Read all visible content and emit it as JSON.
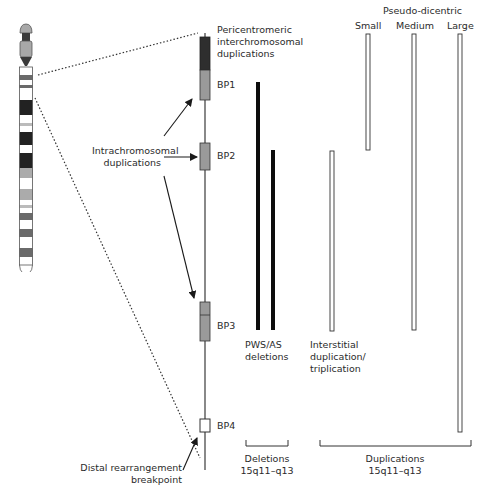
{
  "diagram": {
    "type": "chromosome-15q11-q13-rearrangement-map",
    "chromosome_ideogram": {
      "bands": [
        {
          "y": 67,
          "h": 8,
          "shade": "#ffffff"
        },
        {
          "y": 75,
          "h": 5,
          "shade": "#6a6a6a"
        },
        {
          "y": 80,
          "h": 5,
          "shade": "#ffffff"
        },
        {
          "y": 85,
          "h": 3,
          "shade": "#6a6a6a"
        },
        {
          "y": 88,
          "h": 12,
          "shade": "#ffffff"
        },
        {
          "y": 100,
          "h": 15,
          "shade": "#222222"
        },
        {
          "y": 115,
          "h": 8,
          "shade": "#ffffff"
        },
        {
          "y": 123,
          "h": 3,
          "shade": "#bbbbbb"
        },
        {
          "y": 126,
          "h": 6,
          "shade": "#ffffff"
        },
        {
          "y": 132,
          "h": 13,
          "shade": "#222222"
        },
        {
          "y": 145,
          "h": 8,
          "shade": "#ffffff"
        },
        {
          "y": 153,
          "h": 15,
          "shade": "#222222"
        },
        {
          "y": 168,
          "h": 10,
          "shade": "#ababab"
        },
        {
          "y": 178,
          "h": 11,
          "shade": "#ffffff"
        },
        {
          "y": 189,
          "h": 11,
          "shade": "#ababab"
        },
        {
          "y": 200,
          "h": 5,
          "shade": "#ffffff"
        },
        {
          "y": 205,
          "h": 3,
          "shade": "#bbbbbb"
        },
        {
          "y": 208,
          "h": 5,
          "shade": "#ffffff"
        },
        {
          "y": 213,
          "h": 7,
          "shade": "#6a6a6a"
        },
        {
          "y": 220,
          "h": 9,
          "shade": "#ffffff"
        },
        {
          "y": 229,
          "h": 8,
          "shade": "#6a6a6a"
        },
        {
          "y": 237,
          "h": 11,
          "shade": "#ffffff"
        },
        {
          "y": 248,
          "h": 9,
          "shade": "#6a6a6a"
        },
        {
          "y": 257,
          "h": 8,
          "shade": "#ffffff"
        }
      ]
    },
    "labels": {
      "pericentromeric": [
        "Pericentromeric",
        "interchromosomal",
        "duplications"
      ],
      "bp1": "BP1",
      "bp2": "BP2",
      "bp3": "BP3",
      "bp4": "BP4",
      "intrachromosomal": [
        "Intrachromosomal",
        "duplications"
      ],
      "distal": [
        "Distal rearrangement",
        "breakpoint"
      ],
      "pseudo_dicentric": "Pseudo-dicentric",
      "small": "Small",
      "medium": "Medium",
      "large": "Large",
      "pws_as": [
        "PWS/AS",
        "deletions"
      ],
      "interstitial": [
        "Interstitial",
        "duplication/",
        "triplication"
      ],
      "deletions_group": [
        "Deletions",
        "15q11–q13"
      ],
      "duplications_group": [
        "Duplications",
        "15q11–q13"
      ]
    },
    "breakpoints": [
      {
        "name": "BP1",
        "y_top": 37,
        "y_bottom": 100,
        "style": "dark-over-grey"
      },
      {
        "name": "BP2",
        "y_top": 143,
        "y_bottom": 170,
        "style": "grey"
      },
      {
        "name": "BP3",
        "y_top": 302,
        "y_bottom": 341,
        "style": "grey-split"
      },
      {
        "name": "BP4",
        "y_top": 420,
        "y_bottom": 432,
        "style": "white"
      }
    ],
    "rearrangements": [
      {
        "group": "Deletions",
        "name": "PWS/AS deletion (BP1–BP3)",
        "from": "BP1",
        "to": "BP3",
        "fill": "solid"
      },
      {
        "group": "Deletions",
        "name": "PWS/AS deletion (BP2–BP3)",
        "from": "BP2",
        "to": "BP3",
        "fill": "solid"
      },
      {
        "group": "Duplications",
        "name": "Interstitial duplication/triplication",
        "from": "BP2",
        "to": "BP3",
        "fill": "hollow"
      },
      {
        "group": "Duplications",
        "name": "Pseudo-dicentric Small",
        "from": "cen",
        "to": "BP2",
        "fill": "hollow"
      },
      {
        "group": "Duplications",
        "name": "Pseudo-dicentric Medium",
        "from": "cen",
        "to": "BP3",
        "fill": "hollow"
      },
      {
        "group": "Duplications",
        "name": "Pseudo-dicentric Large",
        "from": "cen",
        "to": "BP4",
        "fill": "hollow"
      }
    ],
    "colors": {
      "line": "#3a3a3a",
      "box_grey": "#9a9a9a",
      "box_dark": "#2e2e2e",
      "bar_solid": "#0d0d0d",
      "text": "#2b2b2b"
    }
  }
}
